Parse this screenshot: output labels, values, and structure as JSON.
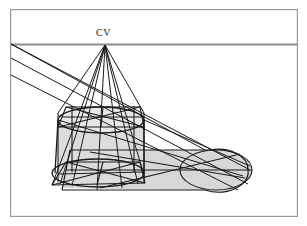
{
  "figure": {
    "type": "technical-perspective-diagram",
    "labels": {
      "vanishing_point": "CV"
    },
    "colors": {
      "frame": "#9a9a9a",
      "horizon": "#8c8c8c",
      "ink": "#1a1a1a",
      "fill_shadow": "#d7d7d7",
      "fill_body": "#dcdcdc",
      "fill_top": "#e6e6e6",
      "background": "#ffffff"
    },
    "frame": {
      "x": 10,
      "y": 9,
      "width": 288,
      "height": 208,
      "stroke_width": 1.2
    },
    "horizon_line": {
      "y": 44,
      "x_start": 11,
      "x_end": 297,
      "stroke_width": 2
    },
    "vanishing_point": {
      "x": 105,
      "y": 45,
      "label": "CV",
      "label_x": 96,
      "label_y": 27
    },
    "light_rays_origin": [
      {
        "x": 11,
        "y": 44
      },
      {
        "x": 11,
        "y": 58
      },
      {
        "x": 11,
        "y": 75
      }
    ],
    "cylinder": {
      "top_ellipse": {
        "cx": 101,
        "cy": 120,
        "rx": 43,
        "ry": 13
      },
      "bottom_ellipse": {
        "cx": 97,
        "cy": 174,
        "rx": 47,
        "ry": 15
      },
      "top_square": {
        "left": 58,
        "right": 144,
        "front_y": 127,
        "back_y": 113
      },
      "bottom_square": {
        "left": 50,
        "right": 144,
        "front_y": 182,
        "back_y": 166
      },
      "body_left_x": 58,
      "body_right_x": 144,
      "body_top_y": 120,
      "body_bottom_y": 174
    },
    "shadow": {
      "tip_x": 252,
      "near_y": 152,
      "far_y": 192,
      "cap_rx": 12,
      "cap_ry": 20,
      "fill": "#d7d7d7"
    }
  }
}
